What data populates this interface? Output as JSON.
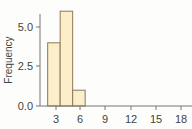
{
  "chart_data": {
    "type": "bar",
    "subtype": "histogram",
    "title": "",
    "xlabel": "",
    "ylabel": "Frequency",
    "bins": [
      {
        "start": 2.0,
        "end": 3.5,
        "count": 4
      },
      {
        "start": 3.5,
        "end": 5.0,
        "count": 6
      },
      {
        "start": 5.0,
        "end": 6.5,
        "count": 1
      }
    ],
    "categories": [
      "2.0-3.5",
      "3.5-5.0",
      "5.0-6.5"
    ],
    "values": [
      4,
      6,
      1
    ],
    "xlim": [
      0.5,
      19
    ],
    "ylim": [
      0,
      6.2
    ],
    "x_ticks": [
      "3",
      "6",
      "9",
      "12",
      "15",
      "18"
    ],
    "y_ticks": [
      "0.0",
      "2.5",
      "5.0"
    ],
    "grid": false,
    "legend": null,
    "colors": {
      "bar_fill": "#fbeec8",
      "bar_stroke": "#8a7a5a",
      "axis": "#666666"
    }
  }
}
